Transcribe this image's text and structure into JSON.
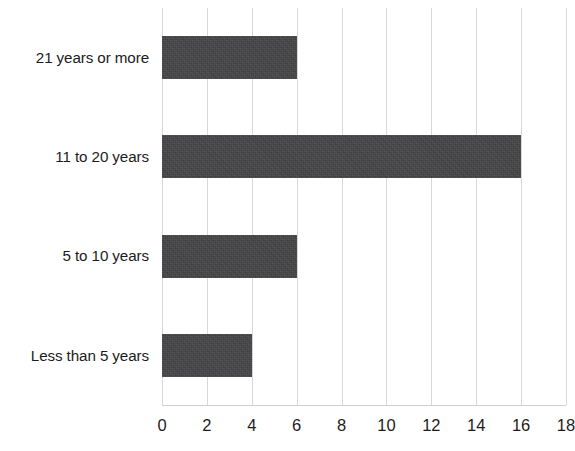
{
  "chart_data": {
    "type": "bar",
    "orientation": "horizontal",
    "title": "",
    "subtitle": "",
    "xlabel": "",
    "ylabel": "",
    "categories": [
      "Less than 5 years",
      "5 to 10 years",
      "11 to 20 years",
      "21 years or more"
    ],
    "values": [
      4,
      6,
      16,
      6
    ],
    "category_order_top_to_bottom": [
      "21 years or more",
      "11 to 20 years",
      "5 to 10 years",
      "Less than 5 years"
    ],
    "values_top_to_bottom": [
      6,
      16,
      6,
      4
    ],
    "xlim": [
      0,
      18
    ],
    "xticks": [
      0,
      2,
      4,
      6,
      8,
      10,
      12,
      14,
      16,
      18
    ],
    "xtick_labels": [
      "0",
      "2",
      "4",
      "6",
      "8",
      "10",
      "12",
      "14",
      "16",
      "18"
    ],
    "grid": "vertical",
    "legend": "none",
    "bar_color": "#444446",
    "gridline_color": "#d8d8d8",
    "text_color": "#1c1c1c",
    "background_color": "#ffffff"
  }
}
